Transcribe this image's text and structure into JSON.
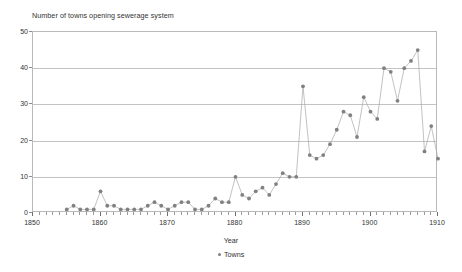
{
  "chart_data": {
    "type": "line",
    "title": "Number of towns opening sewerage system",
    "xlabel": "Year",
    "ylabel": "",
    "xlim": [
      1850,
      1910
    ],
    "ylim": [
      0,
      50
    ],
    "grid": true,
    "legend_position": "bottom",
    "marker": "circle",
    "series_color": "#808080",
    "line_color": "#a8a8a8",
    "x_ticks": [
      1850,
      1860,
      1870,
      1880,
      1890,
      1900,
      1910
    ],
    "x_minor_tick_step": 1,
    "y_ticks": [
      0,
      10,
      20,
      30,
      40,
      50
    ],
    "series": [
      {
        "name": "Towns",
        "x": [
          1855,
          1856,
          1857,
          1858,
          1859,
          1860,
          1861,
          1862,
          1863,
          1864,
          1865,
          1866,
          1867,
          1868,
          1869,
          1870,
          1871,
          1872,
          1873,
          1874,
          1875,
          1876,
          1877,
          1878,
          1879,
          1880,
          1881,
          1882,
          1883,
          1884,
          1885,
          1886,
          1887,
          1888,
          1889,
          1890,
          1891,
          1892,
          1893,
          1894,
          1895,
          1896,
          1897,
          1898,
          1899,
          1900,
          1901,
          1902,
          1903,
          1904,
          1905,
          1906,
          1907,
          1908,
          1909,
          1910
        ],
        "y": [
          1,
          2,
          1,
          1,
          1,
          6,
          2,
          2,
          1,
          1,
          1,
          1,
          2,
          3,
          2,
          1,
          2,
          3,
          3,
          1,
          1,
          2,
          4,
          3,
          3,
          10,
          5,
          4,
          6,
          7,
          5,
          8,
          11,
          10,
          10,
          35,
          16,
          15,
          16,
          19,
          23,
          28,
          27,
          21,
          32,
          28,
          26,
          40,
          39,
          31,
          40,
          42,
          45,
          17,
          24,
          15
        ]
      }
    ]
  },
  "legend": {
    "entries": [
      {
        "label": "Towns",
        "marker": "circle-marker"
      }
    ]
  },
  "axis": {
    "x_title": "Year"
  }
}
